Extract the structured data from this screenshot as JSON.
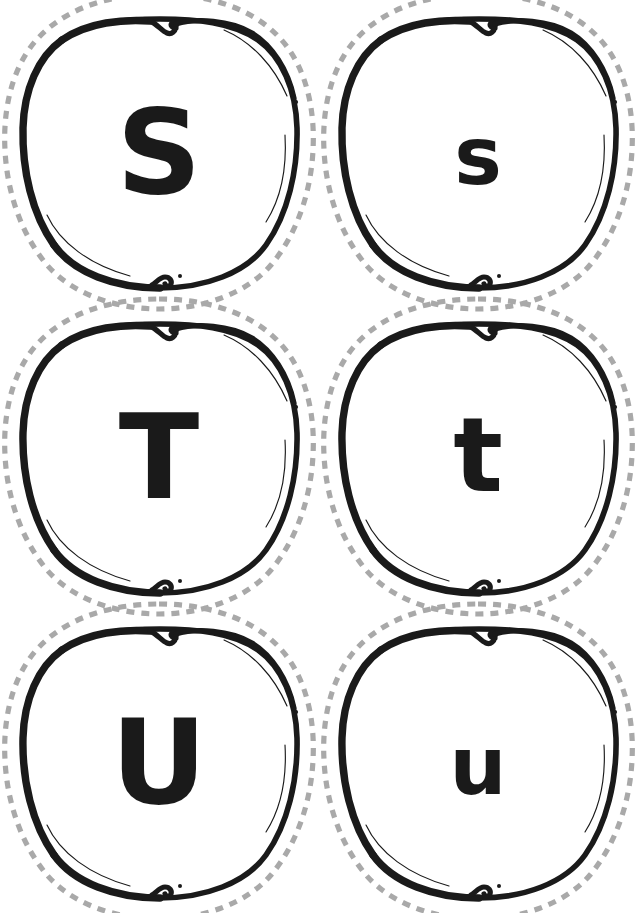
{
  "page": {
    "background_color": "#ffffff",
    "width": 637,
    "height": 913,
    "columns": 2,
    "rows": 3
  },
  "style": {
    "cut_line_color": "#a9a9a9",
    "outline_color": "#1a1a1a",
    "apple_fill_color": "#ffffff",
    "letter_color": "#1a1a1a"
  },
  "cards": [
    {
      "id": "card-1",
      "letter": "S",
      "case": "uppercase",
      "font_size": 118,
      "x": 0,
      "y": 0,
      "shape": "apple",
      "cut_line": "dashed"
    },
    {
      "id": "card-2",
      "letter": "s",
      "case": "lowercase",
      "font_size": 80,
      "x": 319,
      "y": 0,
      "shape": "apple",
      "cut_line": "dashed"
    },
    {
      "id": "card-3",
      "letter": "T",
      "case": "uppercase",
      "font_size": 118,
      "x": 0,
      "y": 305,
      "shape": "apple",
      "cut_line": "dashed"
    },
    {
      "id": "card-4",
      "letter": "t",
      "case": "lowercase",
      "font_size": 104,
      "x": 319,
      "y": 305,
      "shape": "apple",
      "cut_line": "dashed"
    },
    {
      "id": "card-5",
      "letter": "U",
      "case": "uppercase",
      "font_size": 118,
      "x": 0,
      "y": 610,
      "shape": "apple",
      "cut_line": "dashed"
    },
    {
      "id": "card-6",
      "letter": "u",
      "case": "lowercase",
      "font_size": 80,
      "x": 319,
      "y": 610,
      "shape": "apple",
      "cut_line": "dashed"
    }
  ],
  "icons": {
    "apple_shape": "apple-outline-icon",
    "cut_line": "scissors-dashed-cut-line-icon",
    "stem": "apple-stem-notch-icon"
  }
}
